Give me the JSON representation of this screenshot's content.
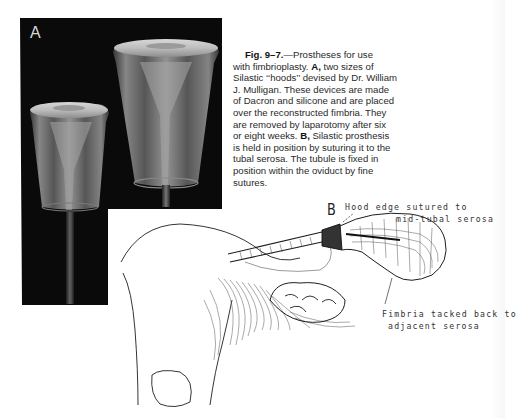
{
  "figure": {
    "number": "Fig. 9-7.",
    "panel_a_label": "A",
    "panel_b_label": "B",
    "caption": {
      "lines": [
        {
          "prefix_bold": "Fig. 9–7.",
          "text": "—Prostheses for use"
        },
        {
          "text": "with fimbrioplasty. ",
          "bold": "A,",
          "text2": " two sizes of"
        },
        {
          "text": "Silastic ‘‘hoods’’ devised by Dr. William"
        },
        {
          "text": "J. Mulligan. These devices are made"
        },
        {
          "text": "of Dacron and silicone and are placed"
        },
        {
          "text": "over the reconstructed fimbria. They"
        },
        {
          "text": "are removed by laparotomy after six"
        },
        {
          "text": "or eight weeks. ",
          "bold": "B,",
          "text2": " Silastic prosthesis"
        },
        {
          "text": "is held in position by suturing it to the"
        },
        {
          "text": "tubal serosa. The tubule is fixed in"
        },
        {
          "text": "position within the oviduct by fine"
        },
        {
          "text": "sutures."
        }
      ]
    },
    "annotations": {
      "hood_edge_line1": "Hood edge sutured to",
      "hood_edge_line2": "mid-tubal serosa",
      "fimbria_line1": "Fimbria tacked back to",
      "fimbria_line2": "adjacent serosa"
    },
    "colors": {
      "photo_background": "#0a0a0a",
      "hood_fill": "#b8b8b8",
      "text": "#2a2a2a",
      "page": "#ffffff"
    }
  }
}
